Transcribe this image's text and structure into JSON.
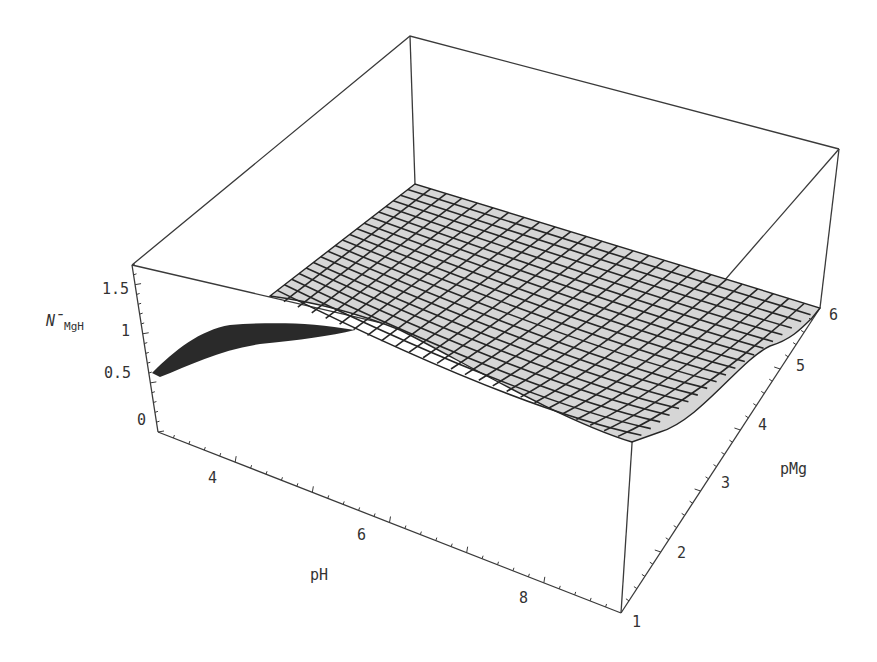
{
  "chart_data": {
    "type": "surface3d",
    "title": "",
    "xlabel": "pH",
    "ylabel": "pMg",
    "zlabel": "N̄MgH",
    "zlabel_main": "N̄",
    "zlabel_sub": "MgH",
    "x_ticks": [
      "4",
      "6",
      "8"
    ],
    "y_ticks": [
      "1",
      "2",
      "3",
      "4",
      "5",
      "6"
    ],
    "z_ticks": [
      "0",
      "0.5",
      "1",
      "1.5"
    ],
    "xlim": [
      3,
      9
    ],
    "ylim": [
      1,
      6
    ],
    "zlim": [
      0,
      1.7
    ],
    "series": [
      {
        "name": "N̄MgH(pH, pMg) at pMg=6",
        "x": [
          3,
          4,
          5,
          6,
          7,
          8,
          9
        ],
        "values": [
          0.5,
          0.95,
          1.0,
          1.0,
          1.0,
          1.0,
          1.0
        ]
      },
      {
        "name": "N̄MgH(pH, pMg) at pMg=1",
        "x": [
          3,
          4,
          5,
          6,
          7,
          8,
          9
        ],
        "values": [
          1.0,
          1.0,
          0.9,
          0.6,
          0.3,
          0.1,
          0.05
        ]
      }
    ],
    "grid": false,
    "box": true,
    "mesh_fill": "#d8d8d8",
    "mesh_line": "#262626",
    "underside_fill": "#2a2a2a"
  }
}
